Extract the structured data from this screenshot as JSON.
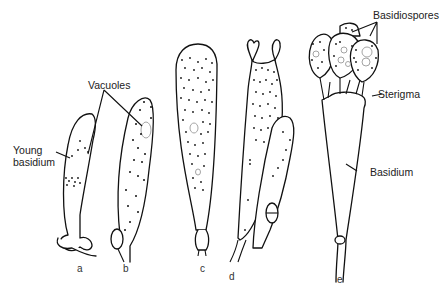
{
  "figure": {
    "labels": {
      "vacuoles": "Vacuoles",
      "young_basidium_line1": "Young",
      "young_basidium_line2": "basidium",
      "basidiospores": "Basidiospores",
      "sterigma": "Sterigma",
      "basidium": "Basidium"
    },
    "stages": [
      {
        "id": "a",
        "label": "a"
      },
      {
        "id": "b",
        "label": "b"
      },
      {
        "id": "c",
        "label": "c"
      },
      {
        "id": "d",
        "label": "d"
      },
      {
        "id": "e",
        "label": "e"
      }
    ],
    "colors": {
      "stroke": "#111111",
      "vacuole": "#9a9a9a",
      "background": "#ffffff"
    }
  }
}
